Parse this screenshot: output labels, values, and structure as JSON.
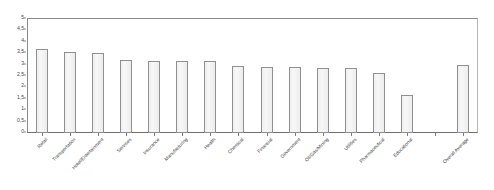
{
  "chart_data": {
    "type": "bar",
    "title": "",
    "subtitle": "",
    "xlabel": "",
    "ylabel": "",
    "ylim": [
      0,
      5
    ],
    "grid": false,
    "legend": null,
    "y_ticks": [
      "0",
      "0,5",
      "1",
      "1,5",
      "2",
      "2,5",
      "3",
      "3,5",
      "4",
      "4,5",
      "5"
    ],
    "y_tick_values": [
      0,
      0.5,
      1,
      1.5,
      2,
      2.5,
      3,
      3.5,
      4,
      4.5,
      5
    ],
    "decimal_separator": ",",
    "categories": [
      "Retail",
      "Transportation",
      "Hotel/Entertainment",
      "Services",
      "Insurance",
      "Manufacturing",
      "Health",
      "Chemical",
      "Financial",
      "Government",
      "Oil/Gas/Mining",
      "Utilities",
      "Pharmaceutical",
      "Educational",
      "",
      "Overall Average"
    ],
    "values": [
      3.7,
      3.55,
      3.5,
      3.2,
      3.15,
      3.15,
      3.15,
      2.95,
      2.9,
      2.9,
      2.85,
      2.85,
      2.65,
      1.65,
      null,
      3.0
    ],
    "series": [
      {
        "name": "",
        "values": [
          3.7,
          3.55,
          3.5,
          3.2,
          3.15,
          3.15,
          3.15,
          2.95,
          2.9,
          2.9,
          2.85,
          2.85,
          2.65,
          1.65,
          null,
          3.0
        ]
      }
    ],
    "colors": {
      "bar_fill": "#f1f1f1",
      "bar_border": "#909090",
      "axis": "#8a8a8a",
      "text": "#3f3f3f",
      "background": "#ffffff"
    }
  }
}
